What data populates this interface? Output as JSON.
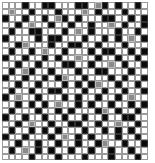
{
  "grid": {
    "columns": 22,
    "rows": 24,
    "legend": {
      "b": "black-cell",
      "g": "gray-cell",
      "w": "white-cell"
    },
    "colors": {
      "black": "#0a0a0a",
      "gray": "#8a8a8a",
      "white": "#ffffff",
      "border": "#9a9a9a"
    },
    "cells": [
      "wwwbwwbbwwwbbwgbwbwwbw",
      "wgwwbwwwbwwwgwbwwwbwww",
      "bwwbwwbwgbwbwwwbbwwbwb",
      "wwbwgwwbwwbwwbwwgwbwwb",
      "wbwwbbwwwbwgwbwwwbwwbw",
      "bwwwwbwbbwwwbwwbwbwgwb",
      "wwbgwwwbwwbbwwbwwwbwww",
      "wbwwbwgwwbwwwbwbbwwbwb",
      "bwwbwwbwbwwgwwbwwbwwbw",
      "wwbwwbwwwbbwwbwwgwbwwb",
      "wbwgbwwbwwwbwwbbwwwbww",
      "bwwbwwbwbgwwbwwwbwbwwb",
      "wwbwwbwwwbwbwbgwwbwwbw",
      "wbwwbwwbbwwwbwwbwwbwwb",
      "bwgwwbwwwbwbwwbwwbwgww",
      "wwbwbwbwgwwbwbwwbwwbwb",
      "wbwwwbwwbwbwwwbgwbwwbw",
      "bwwbwwbwwbwwbwwbwwbbww",
      "wwbwgwwbwwbbwwbwwgwwbw",
      "wbwwbwbwbwwwbwwbwbwbww",
      "bwwbwwwbwgwbwbwwwbwwbw",
      "wwbwwbwwbwwbwwbgwwbwwb",
      "wbwgwbwbwwbwwbwwbwwbww",
      "wwwwbwwwbwwwbwwwbwwwbw"
    ]
  }
}
